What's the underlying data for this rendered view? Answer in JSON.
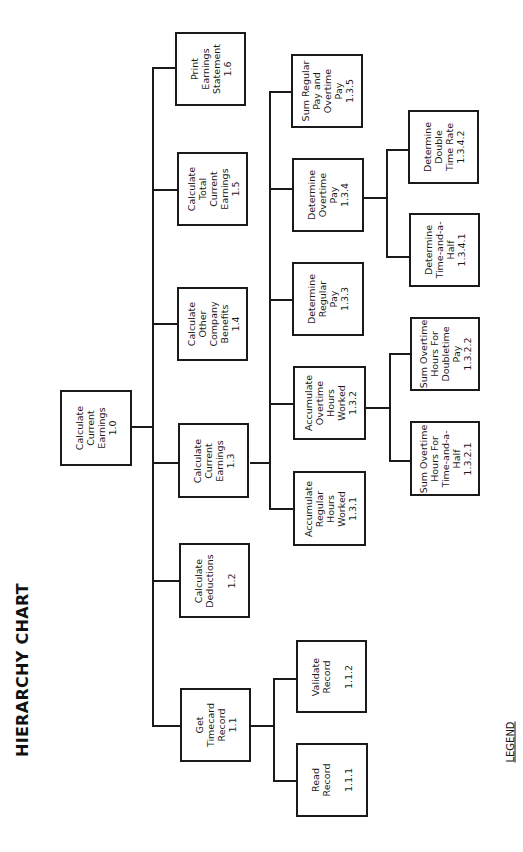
{
  "title": "HIERARCHY CHART",
  "legend": "LEGEND",
  "nodes": {
    "n1_0": {
      "id": "1.0",
      "label": "Calculate\nCurrent\nEarnings\n1.0"
    },
    "n1_1": {
      "id": "1.1",
      "label": "Get\nTimecard\nRecord\n1.1"
    },
    "n1_2": {
      "id": "1.2",
      "label": "Calculate\nDeductions\n\n1.2"
    },
    "n1_3": {
      "id": "1.3",
      "label": "Calculate\nCurrent\nEarnings\n1.3"
    },
    "n1_4": {
      "id": "1.4",
      "label": "Calculate\nOther\nCompany\nBenefits\n1.4"
    },
    "n1_5": {
      "id": "1.5",
      "label": "Calculate\nTotal\nCurrent\nEarnings\n1.5"
    },
    "n1_6": {
      "id": "1.6",
      "label": "Print\nEarnings\nStatement\n1.6"
    },
    "n1_1_1": {
      "id": "1.1.1",
      "label": "Read\nRecord\n\n1.1.1"
    },
    "n1_1_2": {
      "id": "1.1.2",
      "label": "Validate\nRecord\n\n1.1.2"
    },
    "n1_3_1": {
      "id": "1.3.1",
      "label": "Accumulate\nRegular\nHours\nWorked\n1.3.1"
    },
    "n1_3_2": {
      "id": "1.3.2",
      "label": "Accumulate\nOvertime\nHours\nWorked\n1.3.2"
    },
    "n1_3_3": {
      "id": "1.3.3",
      "label": "Determine\nRegular\nPay\n1.3.3"
    },
    "n1_3_4": {
      "id": "1.3.4",
      "label": "Determine\nOvertime\nPay\n1.3.4"
    },
    "n1_3_5": {
      "id": "1.3.5",
      "label": "Sum Regular\nPay and\nOvertime\nPay\n1.3.5"
    },
    "n1_3_2_1": {
      "id": "1.3.2.1",
      "label": "Sum Overtime\nHours For\nTime-and-a-\nHalf\n1.3.2.1"
    },
    "n1_3_2_2": {
      "id": "1.3.2.2",
      "label": "Sum Overtime\nHours For\nDoubletime\nPay\n1.3.2.2"
    },
    "n1_3_4_1": {
      "id": "1.3.4.1",
      "label": "Determine\nTime-and-a-\nHalf\n1.3.4.1"
    },
    "n1_3_4_2": {
      "id": "1.3.4.2",
      "label": "Determine\nDouble\nTime Rate\n1.3.4.2"
    }
  },
  "hierarchy": {
    "1.0": [
      "1.1",
      "1.2",
      "1.3",
      "1.4",
      "1.5",
      "1.6"
    ],
    "1.1": [
      "1.1.1",
      "1.1.2"
    ],
    "1.3": [
      "1.3.1",
      "1.3.2",
      "1.3.3",
      "1.3.4",
      "1.3.5"
    ],
    "1.3.2": [
      "1.3.2.1",
      "1.3.2.2"
    ],
    "1.3.4": [
      "1.3.4.1",
      "1.3.4.2"
    ]
  }
}
